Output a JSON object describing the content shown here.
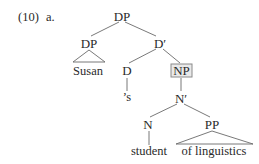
{
  "example": {
    "number": "(10)",
    "letter": "a."
  },
  "tree": {
    "root": {
      "label": "DP"
    },
    "specifier": {
      "label": "DP",
      "leaf": "Susan",
      "leaf_style": "triangle"
    },
    "dbar": {
      "label": "D′"
    },
    "head_d": {
      "label": "D",
      "leaf": "’s"
    },
    "np": {
      "label": "NP",
      "highlighted": true
    },
    "nbar": {
      "label": "N′"
    },
    "head_n": {
      "label": "N",
      "leaf": "student"
    },
    "pp": {
      "label": "PP",
      "leaf": "of linguistics",
      "leaf_style": "triangle"
    }
  },
  "colors": {
    "text": "#2a2a2a",
    "lines": "#6a6a6a",
    "highlight_fill": "#e9e9e9",
    "highlight_border": "#8a8a8a"
  }
}
